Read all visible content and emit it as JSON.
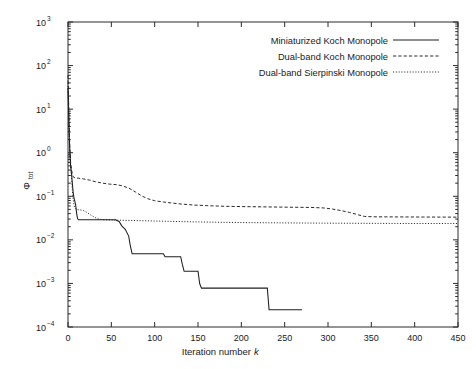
{
  "chart_data": {
    "type": "line",
    "title": "",
    "xlabel": "Iteration number k",
    "xlabel_main": "Iteration number",
    "xlabel_italic": "k",
    "ylabel": "Φtot",
    "ylabel_main": "Φ",
    "ylabel_sub": "tot",
    "yscale": "log",
    "xscale": "linear",
    "xlim": [
      0,
      450
    ],
    "ylim": [
      0.0001,
      1000
    ],
    "grid": false,
    "legend_position": "top-right",
    "xticks": [
      0,
      50,
      100,
      150,
      200,
      250,
      300,
      350,
      400,
      450
    ],
    "xtick_labels": [
      "0",
      "50",
      "100",
      "150",
      "200",
      "250",
      "300",
      "350",
      "400",
      "450"
    ],
    "yticks": [
      0.0001,
      0.001,
      0.01,
      0.1,
      1,
      10,
      100,
      1000
    ],
    "ytick_labels": [
      "10-4",
      "10-3",
      "10-2",
      "10-1",
      "100",
      "101",
      "102",
      "103"
    ],
    "ytick_mantissa": [
      "10",
      "10",
      "10",
      "10",
      "10",
      "10",
      "10",
      "10"
    ],
    "ytick_exponents": [
      "−4",
      "−3",
      "−2",
      "−1",
      "0",
      "1",
      "2",
      "3"
    ],
    "series": [
      {
        "name": "Miniaturized Koch Monopole",
        "style": "solid",
        "color": "#1f1f1f",
        "points": [
          [
            0,
            30
          ],
          [
            0.6,
            12
          ],
          [
            1,
            5
          ],
          [
            1.5,
            2.2
          ],
          [
            2,
            1.2
          ],
          [
            2.5,
            0.75
          ],
          [
            3,
            0.5
          ],
          [
            4,
            0.34
          ],
          [
            5,
            0.2
          ],
          [
            6,
            0.12
          ],
          [
            7,
            0.09
          ],
          [
            8,
            0.075
          ],
          [
            9,
            0.06
          ],
          [
            10,
            0.04
          ],
          [
            11,
            0.031
          ],
          [
            12,
            0.029
          ],
          [
            30,
            0.029
          ],
          [
            55,
            0.029
          ],
          [
            57,
            0.0275
          ],
          [
            59,
            0.0265
          ],
          [
            62,
            0.021
          ],
          [
            66,
            0.0175
          ],
          [
            70,
            0.0122
          ],
          [
            72,
            0.0072
          ],
          [
            74,
            0.0048
          ],
          [
            110,
            0.0048
          ],
          [
            112,
            0.0041
          ],
          [
            130,
            0.0041
          ],
          [
            132,
            0.0027
          ],
          [
            134,
            0.0019
          ],
          [
            150,
            0.0019
          ],
          [
            152,
            0.00098
          ],
          [
            154,
            0.00078
          ],
          [
            230,
            0.00078
          ],
          [
            232,
            0.00025
          ],
          [
            270,
            0.00025
          ]
        ]
      },
      {
        "name": "Dual-band Koch Monopole",
        "style": "dashed",
        "color": "#1f1f1f",
        "points": [
          [
            0,
            60
          ],
          [
            0.6,
            20
          ],
          [
            1,
            7
          ],
          [
            1.5,
            3
          ],
          [
            2,
            1.5
          ],
          [
            2.5,
            0.9
          ],
          [
            3,
            0.6
          ],
          [
            4,
            0.42
          ],
          [
            5,
            0.32
          ],
          [
            6,
            0.28
          ],
          [
            8,
            0.265
          ],
          [
            12,
            0.26
          ],
          [
            18,
            0.25
          ],
          [
            25,
            0.235
          ],
          [
            32,
            0.215
          ],
          [
            40,
            0.2
          ],
          [
            48,
            0.19
          ],
          [
            56,
            0.185
          ],
          [
            62,
            0.175
          ],
          [
            70,
            0.155
          ],
          [
            78,
            0.125
          ],
          [
            85,
            0.102
          ],
          [
            92,
            0.088
          ],
          [
            100,
            0.079
          ],
          [
            110,
            0.074
          ],
          [
            120,
            0.07
          ],
          [
            132,
            0.066
          ],
          [
            145,
            0.063
          ],
          [
            160,
            0.061
          ],
          [
            180,
            0.059
          ],
          [
            200,
            0.058
          ],
          [
            230,
            0.057
          ],
          [
            260,
            0.056
          ],
          [
            280,
            0.0555
          ],
          [
            295,
            0.054
          ],
          [
            305,
            0.051
          ],
          [
            315,
            0.047
          ],
          [
            325,
            0.0425
          ],
          [
            335,
            0.0375
          ],
          [
            342,
            0.0345
          ],
          [
            352,
            0.0338
          ],
          [
            380,
            0.0336
          ],
          [
            410,
            0.0334
          ],
          [
            450,
            0.0332
          ]
        ]
      },
      {
        "name": "Dual-band Sierpinski Monopole",
        "style": "dotted",
        "color": "#1f1f1f",
        "points": [
          [
            0,
            40
          ],
          [
            0.6,
            14
          ],
          [
            1,
            5.5
          ],
          [
            1.5,
            2.4
          ],
          [
            2,
            1.3
          ],
          [
            2.5,
            0.8
          ],
          [
            3,
            0.52
          ],
          [
            4,
            0.28
          ],
          [
            5,
            0.14
          ],
          [
            6,
            0.085
          ],
          [
            7,
            0.062
          ],
          [
            8,
            0.053
          ],
          [
            10,
            0.0495
          ],
          [
            14,
            0.0488
          ],
          [
            18,
            0.047
          ],
          [
            22,
            0.0425
          ],
          [
            26,
            0.0375
          ],
          [
            30,
            0.0335
          ],
          [
            34,
            0.0305
          ],
          [
            40,
            0.029
          ],
          [
            48,
            0.0285
          ],
          [
            60,
            0.0282
          ],
          [
            75,
            0.0278
          ],
          [
            95,
            0.0272
          ],
          [
            120,
            0.0265
          ],
          [
            150,
            0.0258
          ],
          [
            180,
            0.0252
          ],
          [
            215,
            0.0248
          ],
          [
            250,
            0.0245
          ],
          [
            290,
            0.0242
          ],
          [
            330,
            0.024
          ],
          [
            380,
            0.0238
          ],
          [
            450,
            0.0237
          ]
        ]
      }
    ]
  },
  "legend": {
    "entries": [
      {
        "label": "Miniaturized Koch Monopole",
        "style": "solid"
      },
      {
        "label": "Dual-band Koch Monopole",
        "style": "dashed"
      },
      {
        "label": "Dual-band Sierpinski Monopole",
        "style": "dotted"
      }
    ]
  },
  "axes": {
    "x_title_main": "Iteration number",
    "x_title_italic": "k",
    "y_title_main": "Φ",
    "y_title_sub": "tot"
  }
}
